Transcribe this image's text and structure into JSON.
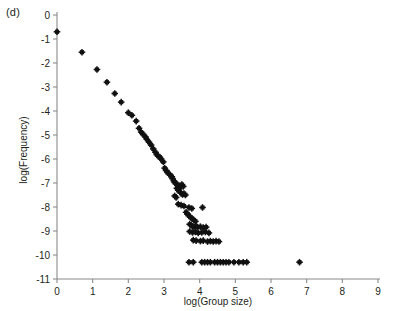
{
  "panel": {
    "label": "(d)"
  },
  "chart_data": {
    "type": "scatter",
    "title": "",
    "xlabel": "log(Group size)",
    "ylabel": "log(Frequency)",
    "xlim": [
      0,
      9
    ],
    "ylim": [
      -11,
      0
    ],
    "xticks": [
      0,
      1,
      2,
      3,
      4,
      5,
      6,
      7,
      8,
      9
    ],
    "xtick_labels": [
      "0",
      "1",
      "2",
      "3",
      "4",
      "5",
      "6",
      "7",
      "8",
      "9"
    ],
    "yticks": [
      0,
      -1,
      -2,
      -3,
      -4,
      -5,
      -6,
      -7,
      -8,
      -9,
      -10,
      -11
    ],
    "ytick_labels": [
      "0",
      "-1",
      "-2",
      "-3",
      "-4",
      "-5",
      "-6",
      "-7",
      "-8",
      "-9",
      "-10",
      "-11"
    ],
    "grid": false,
    "legend": false,
    "marker": "asterisk-square",
    "marker_color": "#111111",
    "series": [
      {
        "name": "group size distribution",
        "points": [
          [
            0.0,
            -0.7
          ],
          [
            0.7,
            -1.55
          ],
          [
            1.12,
            -2.27
          ],
          [
            1.4,
            -2.8
          ],
          [
            1.62,
            -3.27
          ],
          [
            1.8,
            -3.63
          ],
          [
            2.0,
            -4.07
          ],
          [
            2.1,
            -4.18
          ],
          [
            2.22,
            -4.42
          ],
          [
            2.3,
            -4.72
          ],
          [
            2.36,
            -4.88
          ],
          [
            2.42,
            -4.98
          ],
          [
            2.48,
            -5.08
          ],
          [
            2.52,
            -5.18
          ],
          [
            2.58,
            -5.3
          ],
          [
            2.64,
            -5.42
          ],
          [
            2.7,
            -5.58
          ],
          [
            2.76,
            -5.72
          ],
          [
            2.8,
            -5.82
          ],
          [
            2.84,
            -5.88
          ],
          [
            2.88,
            -5.92
          ],
          [
            2.92,
            -6.0
          ],
          [
            2.98,
            -6.12
          ],
          [
            3.02,
            -6.38
          ],
          [
            3.06,
            -6.48
          ],
          [
            3.1,
            -6.56
          ],
          [
            3.14,
            -6.62
          ],
          [
            3.18,
            -6.68
          ],
          [
            3.22,
            -6.74
          ],
          [
            3.24,
            -6.82
          ],
          [
            3.28,
            -6.92
          ],
          [
            3.3,
            -6.98
          ],
          [
            3.34,
            -7.02
          ],
          [
            3.38,
            -7.08
          ],
          [
            3.42,
            -7.12
          ],
          [
            3.46,
            -7.18
          ],
          [
            3.5,
            -7.06
          ],
          [
            3.54,
            -7.14
          ],
          [
            3.36,
            -7.22
          ],
          [
            3.4,
            -7.3
          ],
          [
            3.44,
            -7.36
          ],
          [
            3.48,
            -7.42
          ],
          [
            3.52,
            -7.48
          ],
          [
            3.3,
            -7.54
          ],
          [
            3.34,
            -7.6
          ],
          [
            3.56,
            -7.44
          ],
          [
            3.6,
            -7.5
          ],
          [
            3.4,
            -7.88
          ],
          [
            3.48,
            -7.92
          ],
          [
            3.56,
            -7.96
          ],
          [
            3.7,
            -8.02
          ],
          [
            3.78,
            -8.06
          ],
          [
            4.08,
            -8.02
          ],
          [
            3.62,
            -8.22
          ],
          [
            3.66,
            -8.3
          ],
          [
            3.7,
            -8.36
          ],
          [
            3.74,
            -8.42
          ],
          [
            3.78,
            -8.48
          ],
          [
            3.84,
            -8.54
          ],
          [
            3.88,
            -8.6
          ],
          [
            3.72,
            -8.72
          ],
          [
            3.76,
            -8.76
          ],
          [
            3.8,
            -8.8
          ],
          [
            3.84,
            -8.84
          ],
          [
            3.9,
            -8.8
          ],
          [
            3.94,
            -8.84
          ],
          [
            4.02,
            -8.82
          ],
          [
            4.1,
            -8.86
          ],
          [
            4.18,
            -8.84
          ],
          [
            3.72,
            -9.02
          ],
          [
            3.8,
            -9.06
          ],
          [
            3.88,
            -9.04
          ],
          [
            3.96,
            -9.08
          ],
          [
            4.06,
            -9.06
          ],
          [
            4.16,
            -9.04
          ],
          [
            4.26,
            -9.08
          ],
          [
            3.82,
            -9.38
          ],
          [
            3.9,
            -9.4
          ],
          [
            4.02,
            -9.42
          ],
          [
            4.1,
            -9.4
          ],
          [
            4.22,
            -9.44
          ],
          [
            4.3,
            -9.42
          ],
          [
            4.38,
            -9.44
          ],
          [
            4.46,
            -9.42
          ],
          [
            4.54,
            -9.44
          ],
          [
            3.7,
            -10.3
          ],
          [
            3.82,
            -10.3
          ],
          [
            4.06,
            -10.3
          ],
          [
            4.14,
            -10.3
          ],
          [
            4.22,
            -10.3
          ],
          [
            4.3,
            -10.3
          ],
          [
            4.42,
            -10.3
          ],
          [
            4.5,
            -10.3
          ],
          [
            4.58,
            -10.3
          ],
          [
            4.66,
            -10.3
          ],
          [
            4.74,
            -10.3
          ],
          [
            4.82,
            -10.3
          ],
          [
            4.96,
            -10.3
          ],
          [
            5.1,
            -10.3
          ],
          [
            5.22,
            -10.3
          ],
          [
            5.32,
            -10.3
          ],
          [
            6.8,
            -10.3
          ]
        ]
      }
    ]
  }
}
